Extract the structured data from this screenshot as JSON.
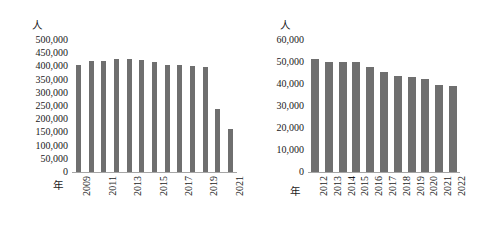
{
  "chart_data": [
    {
      "id": "left",
      "type": "bar",
      "title": "",
      "xlabel": "年",
      "ylabel": "人",
      "ylim": [
        0,
        500000
      ],
      "ytick_labels": [
        "500,000",
        "450,000",
        "400,000",
        "350,000",
        "300,000",
        "250,000",
        "200,000",
        "150,000",
        "100,000",
        "50,000",
        "0"
      ],
      "ytick_values": [
        500000,
        450000,
        400000,
        350000,
        300000,
        250000,
        200000,
        150000,
        100000,
        50000,
        0
      ],
      "grid": false,
      "legend": "none",
      "bar_color": "#6f6f6f",
      "categories": [
        "2009",
        "2010",
        "2011",
        "2012",
        "2013",
        "2014",
        "2015",
        "2016",
        "2017",
        "2018",
        "2019",
        "2020",
        "2021"
      ],
      "xtick_labels_shown": [
        "2009",
        "",
        "2011",
        "",
        "2013",
        "",
        "2015",
        "",
        "2017",
        "",
        "2019",
        "",
        "2021"
      ],
      "values": [
        405000,
        421000,
        421000,
        428000,
        428000,
        425000,
        418000,
        405000,
        404000,
        402000,
        396000,
        240000,
        162000
      ]
    },
    {
      "id": "right",
      "type": "bar",
      "title": "",
      "xlabel": "年",
      "ylabel": "人",
      "ylim": [
        0,
        60000
      ],
      "ytick_labels": [
        "60,000",
        "50,000",
        "40,000",
        "30,000",
        "20,000",
        "10,000",
        "0"
      ],
      "ytick_values": [
        60000,
        50000,
        40000,
        30000,
        20000,
        10000,
        0
      ],
      "grid": false,
      "legend": "none",
      "bar_color": "#6f6f6f",
      "categories": [
        "2012",
        "2013",
        "2014",
        "2015",
        "2016",
        "2017",
        "2018",
        "2019",
        "2020",
        "2021",
        "2022"
      ],
      "xtick_labels_shown": [
        "2012",
        "2013",
        "2014",
        "2015",
        "2016",
        "2017",
        "2018",
        "2019",
        "2020",
        "2021",
        "2022"
      ],
      "values": [
        51500,
        49800,
        49800,
        50100,
        47600,
        45400,
        43600,
        43100,
        42500,
        39400,
        39200
      ]
    }
  ]
}
